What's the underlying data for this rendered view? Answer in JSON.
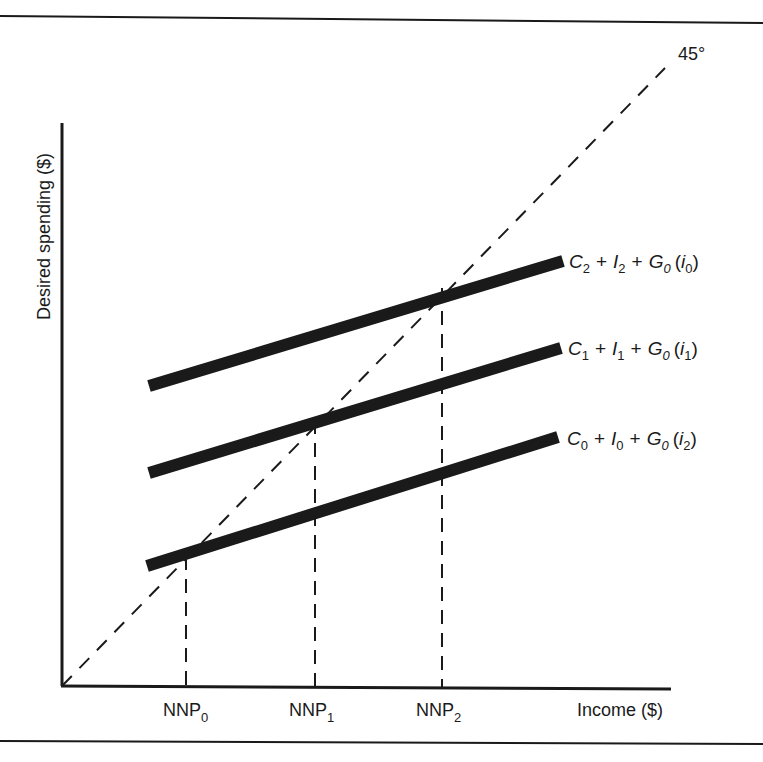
{
  "diagram": {
    "type": "keynesian-cross",
    "frame": {
      "stroke": "#1a1a1a"
    },
    "axes": {
      "y_title": "Desired spending ($)",
      "x_title": "Income ($)"
    },
    "reference_line": {
      "label": "45°",
      "style": "dashed"
    },
    "spending_lines": [
      {
        "id": "upper",
        "label": {
          "C": "C",
          "C_sub": "2",
          "I": "I",
          "I_sub": "2",
          "G": "G",
          "G_sub": "0",
          "i": "i",
          "i_sub": "0"
        },
        "text": "C2 + I2 + G0 (i0)"
      },
      {
        "id": "middle",
        "label": {
          "C": "C",
          "C_sub": "1",
          "I": "I",
          "I_sub": "1",
          "G": "G",
          "G_sub": "0",
          "i": "i",
          "i_sub": "1"
        },
        "text": "C1 + I1 + G0 (i1)"
      },
      {
        "id": "lower",
        "label": {
          "C": "C",
          "C_sub": "0",
          "I": "I",
          "I_sub": "0",
          "G": "G",
          "G_sub": "0",
          "i": "i",
          "i_sub": "2"
        },
        "text": "C0 + I0 + G0 (i2)"
      }
    ],
    "equilibrium_ticks": [
      {
        "base": "NNP",
        "sub": "0"
      },
      {
        "base": "NNP",
        "sub": "1"
      },
      {
        "base": "NNP",
        "sub": "2"
      }
    ],
    "plus": "+"
  }
}
